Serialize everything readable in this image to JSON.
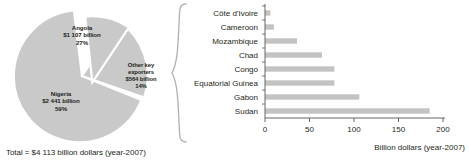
{
  "pie": {
    "total_caption": "Total = $4 113 billion dollars (year-2007)",
    "slice_color": "#c9c9c9",
    "gap_color": "#ffffff",
    "slices": [
      {
        "name": "Nigeria",
        "value_label": "$2 441 billion",
        "percent_label": "59%",
        "percent": 59,
        "value": 2441,
        "exploded": false
      },
      {
        "name": "Angola",
        "value_label": "$1 107 billion",
        "percent_label": "27%",
        "percent": 27,
        "value": 1107,
        "exploded": false
      },
      {
        "name": "Other key exporters",
        "value_label": "$564 billion",
        "percent_label": "14%",
        "percent": 14,
        "value": 564,
        "exploded": true
      }
    ],
    "labels": {
      "angola": {
        "l1": "Angola",
        "l2": "$1 107 billion",
        "l3": "27%"
      },
      "other": {
        "l1": "Other key",
        "l2": "exporters",
        "l3": "$564 billion",
        "l4": "14%"
      },
      "nigeria": {
        "l1": "Nigeria",
        "l2": "$2 441 billion",
        "l3": "59%"
      }
    }
  },
  "chart_data": {
    "type": "bar",
    "orientation": "horizontal",
    "title": "",
    "xlabel": "Billion dollars (year-2007)",
    "ylabel": "",
    "xlim": [
      0,
      200
    ],
    "xticks": [
      0,
      50,
      100,
      150,
      200
    ],
    "xtick_labels": [
      "0",
      "50",
      "100",
      "150",
      "200"
    ],
    "grid": false,
    "bar_color": "#c3c3c3",
    "categories": [
      "Côte d'Ivoire",
      "Cameroon",
      "Mozambique",
      "Chad",
      "Congo",
      "Equatorial Guinea",
      "Gabon",
      "Sudan"
    ],
    "values": [
      6,
      10,
      36,
      64,
      78,
      78,
      106,
      185
    ]
  }
}
